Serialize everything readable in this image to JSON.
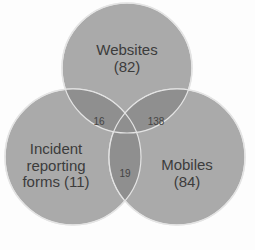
{
  "diagram": {
    "type": "venn",
    "sets": [
      {
        "label": "Websites",
        "count_label": "(82)",
        "value": 82
      },
      {
        "label": "Mobiles",
        "count_label": "(84)",
        "value": 84
      },
      {
        "label_line1": "Incident",
        "label_line2": "reporting",
        "label_line3": "forms (11)",
        "value": 11
      }
    ],
    "intersections": {
      "websites_incident": "16",
      "websites_mobiles": "138",
      "incident_mobiles": "19"
    },
    "colors": {
      "circle_fill": "#a9a9a9",
      "overlap_fill": "#8f8f8f",
      "circle_edge": "#e6e6e6",
      "text": "#3c3c3c"
    }
  }
}
